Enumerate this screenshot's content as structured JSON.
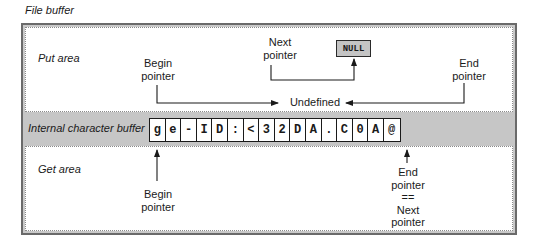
{
  "diagram": {
    "title": "File buffer",
    "put_area": {
      "label": "Put area",
      "begin_pointer": [
        "Begin",
        "pointer"
      ],
      "next_pointer": [
        "Next",
        "pointer"
      ],
      "end_pointer": [
        "End",
        "pointer"
      ],
      "null_box": "NULL",
      "undefined_label": "Undefined"
    },
    "internal_buffer": {
      "label": "Internal character buffer",
      "cells": [
        "g",
        "e",
        "-",
        "I",
        "D",
        ":",
        "<",
        "3",
        "2",
        "D",
        "A",
        ".",
        "C",
        "0",
        "A",
        "@"
      ]
    },
    "get_area": {
      "label": "Get area",
      "begin_pointer": [
        "Begin",
        "pointer"
      ],
      "end_pointer": [
        "End",
        "pointer",
        "==",
        "Next",
        "pointer"
      ]
    },
    "colors": {
      "frame": "#6a6a6a",
      "band": "#c6c6c6",
      "null_fill": "#c4c4c4",
      "ink": "#1a1a1a"
    }
  }
}
